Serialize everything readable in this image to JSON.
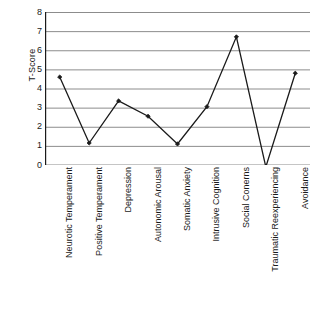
{
  "chart_data": {
    "type": "line",
    "title": "",
    "xlabel": "",
    "ylabel": "T-Score",
    "ylim": [
      0,
      8
    ],
    "ytick_labels": [
      "8",
      "7",
      "6",
      "5",
      "4",
      "3",
      "2",
      "1",
      "0"
    ],
    "yticks": [
      8,
      7,
      6,
      5,
      4,
      3,
      2,
      1,
      0
    ],
    "grid": "horizontal",
    "legend": "none",
    "marker": "diamond",
    "line_color": "#1a1a1a",
    "grid_color": "#8c8c8c",
    "axis_color": "#1a1a1a",
    "categories": [
      "Neurotic Temperament",
      "Positive Temperament",
      "Depression",
      "Autonomic Arousal",
      "Somatic Anxiety",
      "Intrusive Cognition",
      "Social Conerns",
      "Traumatic Reexperiencing",
      "Avoidance"
    ],
    "values": [
      4.6,
      1.15,
      3.35,
      2.55,
      1.1,
      3.05,
      6.7,
      -0.1,
      4.8
    ],
    "series": [
      {
        "name": "T-Score",
        "values": [
          4.6,
          1.15,
          3.35,
          2.55,
          1.1,
          3.05,
          6.7,
          -0.1,
          4.8
        ]
      }
    ]
  }
}
